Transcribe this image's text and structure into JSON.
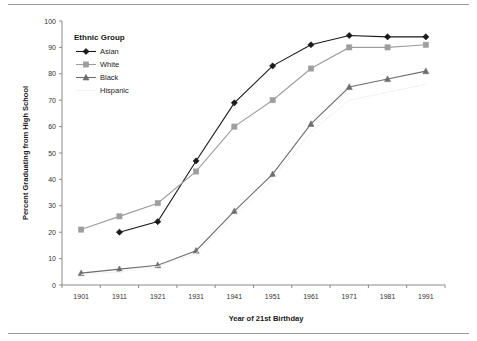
{
  "chart_data": {
    "type": "line",
    "title": "",
    "xlabel": "Year of 21st Birthday",
    "ylabel": "Percent Graduating from High School",
    "x": [
      1901,
      1911,
      1921,
      1931,
      1941,
      1951,
      1961,
      1971,
      1981,
      1991
    ],
    "xtick_labels": [
      "1901",
      "1911",
      "1921",
      "1931",
      "1941",
      "1951",
      "1961",
      "1971",
      "1981",
      "1991"
    ],
    "ytick_labels": [
      "0",
      "10",
      "20",
      "30",
      "40",
      "50",
      "60",
      "70",
      "80",
      "90",
      "100"
    ],
    "ylim": [
      0,
      100
    ],
    "ytick_step": 10,
    "grid": false,
    "legend_position": "top-left",
    "legend_title": "Ethnic Group",
    "series": [
      {
        "name": "Asian",
        "marker": "diamond",
        "color": "#1a1a1a",
        "x": [
          1911,
          1921,
          1931,
          1941,
          1951,
          1961,
          1971,
          1981,
          1991
        ],
        "values": [
          20,
          24,
          47,
          69,
          83,
          91,
          94.5,
          94,
          94
        ]
      },
      {
        "name": "White",
        "marker": "square",
        "color": "#9e9e9e",
        "x": [
          1901,
          1911,
          1921,
          1931,
          1941,
          1951,
          1961,
          1971,
          1981,
          1991
        ],
        "values": [
          21,
          26,
          31,
          43,
          60,
          70,
          82,
          90,
          90,
          91
        ]
      },
      {
        "name": "Black",
        "marker": "triangle",
        "color": "#6e6e6e",
        "x": [
          1901,
          1911,
          1921,
          1931,
          1941,
          1951,
          1961,
          1971,
          1981,
          1991
        ],
        "values": [
          4.5,
          6,
          7.5,
          13,
          28,
          42,
          61,
          75,
          78,
          81
        ]
      },
      {
        "name": "Hispanic",
        "marker": "none",
        "color": "#f2f2f2",
        "x": [
          1901,
          1911,
          1921,
          1931,
          1941,
          1951,
          1961,
          1971,
          1981,
          1991
        ],
        "values": [
          4,
          5,
          7,
          12,
          26,
          40,
          58,
          70,
          73,
          76
        ]
      }
    ]
  },
  "legend": {
    "title": "Ethnic Group",
    "items": [
      {
        "label": "Asian"
      },
      {
        "label": "White"
      },
      {
        "label": "Black"
      },
      {
        "label": "Hispanic"
      }
    ]
  },
  "axes": {
    "x_title": "Year of 21st Birthday",
    "y_title": "Percent Graduating from High School"
  }
}
